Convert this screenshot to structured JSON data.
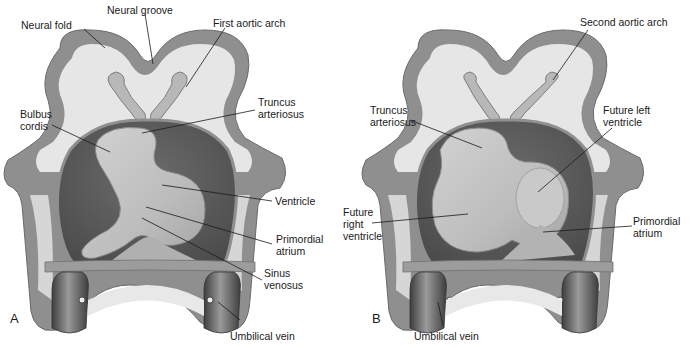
{
  "figure": {
    "background": "#ffffff",
    "colors": {
      "outer_tissue": "#8f8f8f",
      "outer_tissue_edge": "#6a6a6a",
      "inner_cavity": "#e6e6e6",
      "pericardium_dark": "#5e5e5e",
      "heart_light": "#c4c4c4",
      "heart_mid": "#a9a9a9",
      "vessel_dark": "#4a4a4a",
      "leader_line": "#1a1a1a",
      "text": "#1a1a1a"
    }
  },
  "panel_a": {
    "letter": "A",
    "labels": {
      "neural_fold": "Neural fold",
      "neural_groove": "Neural groove",
      "first_aortic_arch": "First aortic arch",
      "truncus_arteriosus_1": "Truncus",
      "truncus_arteriosus_2": "arteriosus",
      "bulbus_cordis_1": "Bulbus",
      "bulbus_cordis_2": "cordis",
      "ventricle": "Ventricle",
      "primordial_atrium_1": "Primordial",
      "primordial_atrium_2": "atrium",
      "sinus_venosus_1": "Sinus",
      "sinus_venosus_2": "venosus",
      "umbilical_vein": "Umbilical vein"
    }
  },
  "panel_b": {
    "letter": "B",
    "labels": {
      "second_aortic_arch": "Second aortic arch",
      "truncus_arteriosus_1": "Truncus",
      "truncus_arteriosus_2": "arteriosus",
      "future_left_ventricle_1": "Future left",
      "future_left_ventricle_2": "ventricle",
      "future_right_ventricle_1": "Future",
      "future_right_ventricle_2": "right",
      "future_right_ventricle_3": "ventricle",
      "primordial_atrium_1": "Primordial",
      "primordial_atrium_2": "atrium",
      "umbilical_vein": "Umbilical vein"
    }
  }
}
